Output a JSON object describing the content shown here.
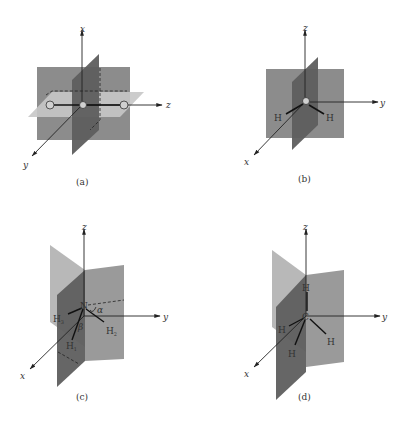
{
  "figure": {
    "panels": [
      {
        "id": "a",
        "caption": "(a)",
        "molecule": "CO2",
        "center_atom": "C",
        "atoms": [
          "O",
          "C",
          "O"
        ],
        "axes": {
          "vertical": "x",
          "horizontal": "z",
          "diagonal": "y"
        }
      },
      {
        "id": "b",
        "caption": "(b)",
        "molecule": "H2O",
        "center_atom": "O",
        "atoms": [
          "H",
          "O",
          "H"
        ],
        "axes": {
          "vertical": "z",
          "horizontal": "y",
          "diagonal": "x"
        }
      },
      {
        "id": "c",
        "caption": "(c)",
        "molecule": "NH3",
        "center_atom": "N",
        "atoms": [
          "N",
          "H1",
          "H2",
          "H3"
        ],
        "atom_labels": {
          "h1": "H",
          "h1_sub": "1",
          "h2": "H",
          "h2_sub": "2",
          "h3": "H",
          "h3_sub": "3"
        },
        "angle_labels": {
          "alpha": "α",
          "beta": "β"
        },
        "axes": {
          "vertical": "z",
          "horizontal": "y",
          "diagonal": "x"
        }
      },
      {
        "id": "d",
        "caption": "(d)",
        "molecule": "CH4",
        "center_atom": "C",
        "atoms": [
          "C",
          "H",
          "H",
          "H",
          "H"
        ],
        "axes": {
          "vertical": "z",
          "horizontal": "y",
          "diagonal": "x"
        }
      }
    ]
  },
  "colors": {
    "plane_mid": "#8c8c8c",
    "plane_dark": "#5e5e5e",
    "plane_light": "#b8b8b8",
    "axis": "#222222"
  }
}
